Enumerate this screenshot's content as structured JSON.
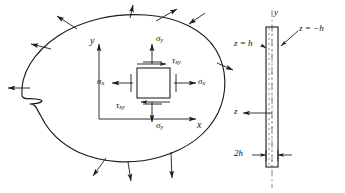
{
  "figure": {
    "stroke_color": "#1a1a1a",
    "background_color": "#ffffff"
  },
  "body_diagram": {
    "name": "two-dimensional-elastic-body",
    "axes": {
      "y_label": "y",
      "x_label": "x"
    },
    "stress_element": {
      "sigma_x_left": "σ",
      "sigma_x_left_sub": "x",
      "sigma_x_right": "σ",
      "sigma_x_right_sub": "x",
      "sigma_y_top": "σ",
      "sigma_y_top_sub": "y",
      "sigma_y_bottom": "σ",
      "sigma_y_bottom_sub": "y",
      "tau_top": "τ",
      "tau_top_sub": "xy",
      "tau_bottom": "τ",
      "tau_bottom_sub": "xy"
    },
    "boundary_traction_count": 10
  },
  "plate_diagram": {
    "name": "plate-edge-view",
    "y_axis_label": "y",
    "z_axis_label": "z",
    "top_surface_label": "z = h",
    "bottom_surface_label": "z = −h",
    "thickness_label": "2h",
    "thickness_value": "2h"
  }
}
